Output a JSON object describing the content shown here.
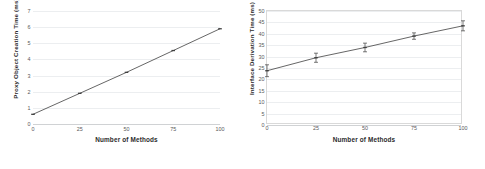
{
  "figure": {
    "background": "#ffffff",
    "line_color": "#3f3f3f",
    "grid_color": "#eceef0",
    "text_color": "#2b2b2b"
  },
  "chart_data": [
    {
      "type": "line",
      "panel": "left",
      "title": "",
      "xlabel": "Number of Methods",
      "ylabel": "Proxy Object Creation Time (ms)",
      "x": [
        0,
        25,
        50,
        75,
        100
      ],
      "values": [
        0.6,
        1.9,
        3.2,
        4.55,
        5.9
      ],
      "xlim": [
        0,
        100
      ],
      "ylim": [
        0,
        7
      ],
      "xticks": [
        0,
        25,
        50,
        75,
        100
      ],
      "yticks": [
        0,
        1,
        2,
        3,
        4,
        5,
        6,
        7
      ],
      "xticklabels": [
        "0",
        "25",
        "50",
        "75",
        "100"
      ],
      "yticklabels": [
        "0",
        "1",
        "2",
        "3",
        "4",
        "5",
        "6",
        "7"
      ],
      "grid": true,
      "legend": false,
      "errors": [
        0,
        0,
        0,
        0,
        0
      ],
      "marker": "dash"
    },
    {
      "type": "line",
      "panel": "right",
      "title": "",
      "xlabel": "Number of Methods",
      "ylabel": "Interface Derivation Time (ms)",
      "x": [
        0,
        25,
        50,
        75,
        100
      ],
      "values": [
        23.8,
        29.5,
        34.0,
        39.0,
        43.5
      ],
      "xlim": [
        0,
        100
      ],
      "ylim": [
        0,
        50
      ],
      "xticks": [
        0,
        25,
        50,
        75,
        100
      ],
      "yticks": [
        0,
        5,
        10,
        15,
        20,
        25,
        30,
        35,
        40,
        45,
        50
      ],
      "xticklabels": [
        "0",
        "25",
        "50",
        "75",
        "100"
      ],
      "yticklabels": [
        "0",
        "5",
        "10",
        "15",
        "20",
        "25",
        "30",
        "35",
        "40",
        "45",
        "50"
      ],
      "grid": true,
      "legend": false,
      "errors": [
        2.6,
        2.0,
        1.9,
        1.4,
        2.2
      ],
      "marker": "dash"
    }
  ]
}
